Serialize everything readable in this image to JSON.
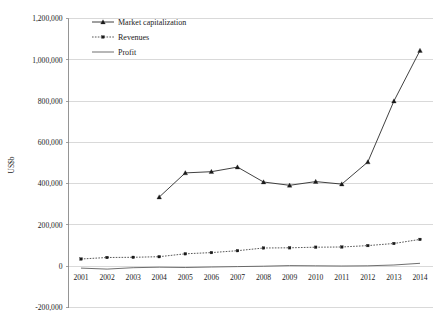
{
  "chart_data": {
    "type": "line",
    "title": "",
    "xlabel": "",
    "ylabel": "US$b",
    "x": [
      2001,
      2002,
      2003,
      2004,
      2005,
      2006,
      2007,
      2008,
      2009,
      2010,
      2011,
      2012,
      2013,
      2014
    ],
    "xtick_labels": [
      "2001",
      "2002",
      "2003",
      "2004",
      "2005",
      "2006",
      "2007",
      "2008",
      "2009",
      "2010",
      "2011",
      "2012",
      "2013",
      "2014"
    ],
    "ytick_labels": [
      "1,200,000",
      "1,000,000",
      "800,000",
      "600,000",
      "400,000",
      "200,000",
      "0",
      "-200,000"
    ],
    "ytick_values": [
      1200000,
      1000000,
      800000,
      600000,
      400000,
      200000,
      0,
      -200000
    ],
    "ylim": [
      -200000,
      1200000
    ],
    "grid": "horizontal",
    "legend_position": "top-left-inside",
    "series": [
      {
        "name": "Market capitalization",
        "style": "solid-with-triangle-markers",
        "values": [
          null,
          null,
          null,
          335000,
          452000,
          458000,
          480000,
          408000,
          392000,
          410000,
          398000,
          505000,
          800000,
          1045000
        ]
      },
      {
        "name": "Revenues",
        "style": "dotted-with-markers",
        "values": [
          35000,
          42000,
          43000,
          46000,
          60000,
          66000,
          75000,
          88000,
          89000,
          92000,
          93000,
          100000,
          110000,
          130000
        ]
      },
      {
        "name": "Profit",
        "style": "solid-no-markers",
        "values": [
          -9000,
          -14000,
          -7000,
          -5000,
          -6000,
          -4000,
          -2000,
          0,
          3000,
          2000,
          1000,
          2000,
          6000,
          14000
        ]
      }
    ]
  },
  "legend": {
    "items": [
      {
        "label": "Market capitalization"
      },
      {
        "label": "Revenues"
      },
      {
        "label": "Profit"
      }
    ]
  },
  "axes": {
    "y_title": "US$b"
  },
  "colors": {
    "background": "#ffffff",
    "gridline": "#c9c9c9",
    "axis": "#8a8a8a",
    "series_market_cap": "#2b2b2b",
    "series_revenues": "#3a3a3a",
    "series_profit": "#555555",
    "text": "#1a1a1a"
  }
}
